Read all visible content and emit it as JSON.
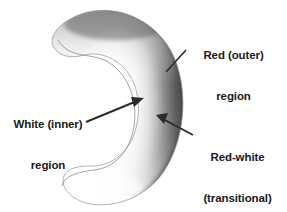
{
  "figure": {
    "type": "annotated-diagram",
    "background_color": "#ffffff"
  },
  "labels": [
    {
      "id": "red-outer",
      "lines": [
        "Red (outer)",
        "region"
      ],
      "position": "top-right",
      "connector": "leader-line",
      "target": "outer rim of crescent"
    },
    {
      "id": "white-inner",
      "lines": [
        "White (inner)",
        "region"
      ],
      "position": "left",
      "connector": "arrow",
      "target": "inner white area of crescent"
    },
    {
      "id": "red-white-transitional",
      "lines": [
        "Red-white",
        "(transitional)",
        "region"
      ],
      "position": "bottom-right",
      "connector": "arrow",
      "target": "gradient band between white and red"
    }
  ],
  "colors": {
    "text": "#1a1a1a",
    "connector": "#2b2b2b",
    "outer_rim_dark": "#4a4a4a",
    "outer_rim_mid": "#6e6e6e",
    "transitional_gray": "#b4b4b4",
    "inner_white": "#fdfdfd",
    "outline": "#8a8a8a",
    "background": "#ffffff"
  }
}
